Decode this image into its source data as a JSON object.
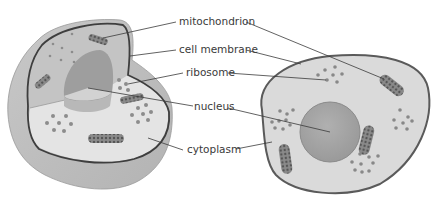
{
  "diagram": {
    "type": "labeled-illustration",
    "labels": [
      {
        "id": "mitochondrion",
        "text": "mitochondrion"
      },
      {
        "id": "cell-membrane",
        "text": "cell membrane"
      },
      {
        "id": "ribosome",
        "text": "ribosome"
      },
      {
        "id": "nucleus",
        "text": "nucleus"
      },
      {
        "id": "cytoplasm",
        "text": "cytoplasm"
      }
    ]
  },
  "colors": {
    "membrane": "#4a4a4a",
    "cytoplasm": "#d9d9d9",
    "cytoplasm_light": "#e6e6e6",
    "outer_body": "#bfbfbf",
    "nucleus": "#a9a9a9",
    "organelle": "#777777",
    "leader_line": "#3a3a3a",
    "label_text": "#3a3a3a"
  }
}
